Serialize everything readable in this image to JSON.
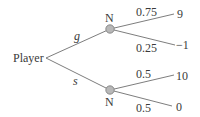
{
  "diagram": {
    "type": "game-tree",
    "root": {
      "label": "Player"
    },
    "branches": [
      {
        "action": "g",
        "node": "N",
        "outcomes": [
          {
            "prob": "0.75",
            "payoff": "9"
          },
          {
            "prob": "0.25",
            "payoff": "−1"
          }
        ]
      },
      {
        "action": "s",
        "node": "N",
        "outcomes": [
          {
            "prob": "0.5",
            "payoff": "10"
          },
          {
            "prob": "0.5",
            "payoff": "0"
          }
        ]
      }
    ],
    "colors": {
      "line": "#6e6e6e",
      "node_fill": "#b8b8b8",
      "node_stroke": "#7a7a7a",
      "text": "#3a3a3a"
    }
  }
}
